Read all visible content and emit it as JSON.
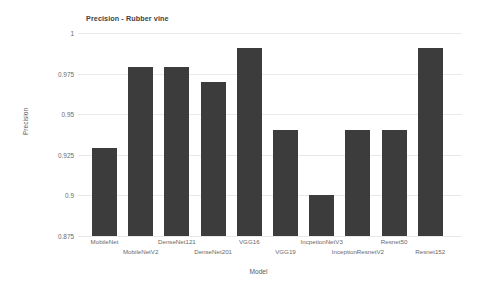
{
  "chart_data": {
    "type": "bar",
    "title": "Precision - Rubber vine",
    "xlabel": "Model",
    "ylabel": "Precision",
    "ylim": [
      0.875,
      1.0
    ],
    "yticks": [
      1,
      0.975,
      0.95,
      0.925,
      0.9,
      0.875
    ],
    "ytick_labels": [
      "1",
      "0.975",
      "0.95",
      "0.925",
      "0.9",
      "0.875"
    ],
    "grid": true,
    "legend": null,
    "bar_color": "#3c3c3c",
    "categories": [
      "MobileNet",
      "MobileNetV2",
      "DenseNet121",
      "DenseNet201",
      "VGG16",
      "VGG19",
      "IncpetionNetV3",
      "InceptionResnetV2",
      "Resnet50",
      "Resnet152"
    ],
    "values": [
      0.929,
      0.979,
      0.979,
      0.97,
      0.991,
      0.94,
      0.9,
      0.94,
      0.94,
      0.991
    ]
  }
}
